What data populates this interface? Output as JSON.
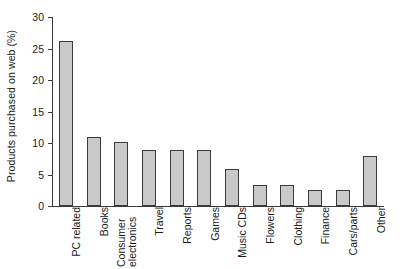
{
  "chart_data": {
    "type": "bar",
    "title": "",
    "xlabel": "",
    "ylabel": "Products purchased on web (%)",
    "categories": [
      "PC related",
      "Books",
      "Consumer electronics",
      "Travel",
      "Reports",
      "Games",
      "Music CDs",
      "Flowers",
      "Clothing",
      "Finance",
      "Cars/parts",
      "Other"
    ],
    "values": [
      26.2,
      11.0,
      10.2,
      8.9,
      8.9,
      8.9,
      5.8,
      3.4,
      3.4,
      2.5,
      2.5,
      8.0
    ],
    "ylim": [
      0,
      30
    ],
    "yticks": [
      0,
      5,
      10,
      15,
      20,
      25,
      30
    ],
    "ytick_labels": [
      "0",
      "5",
      "10",
      "15",
      "20",
      "25",
      "30"
    ],
    "grid": false,
    "legend": false,
    "bar_color": "#c9c9c9",
    "bar_edge_color": "#3a3a3a",
    "axis_color": "#3a3a3a",
    "background_color": "#ffffff",
    "label_orientation": "vertical",
    "category_label_lines": [
      [
        "PC related"
      ],
      [
        "Books"
      ],
      [
        "Consumer",
        "electronics"
      ],
      [
        "Travel"
      ],
      [
        "Reports"
      ],
      [
        "Games"
      ],
      [
        "Music CDs"
      ],
      [
        "Flowers"
      ],
      [
        "Clothing"
      ],
      [
        "Finance"
      ],
      [
        "Cars/parts"
      ],
      [
        "Other"
      ]
    ]
  }
}
